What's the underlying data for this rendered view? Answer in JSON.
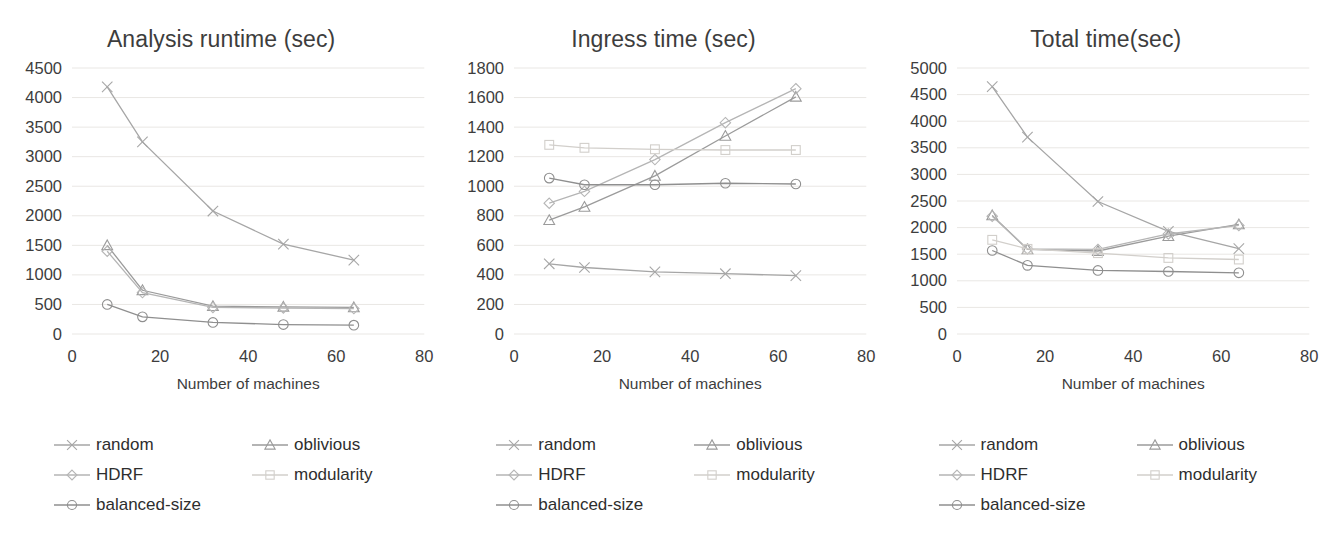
{
  "series_meta": [
    {
      "key": "random",
      "label": "random",
      "marker": "cross",
      "color": "#a6a6a6"
    },
    {
      "key": "oblivious",
      "label": "oblivious",
      "marker": "triangle",
      "color": "#9b9b9b"
    },
    {
      "key": "HDRF",
      "label": "HDRF",
      "marker": "diamond",
      "color": "#b5b5b5"
    },
    {
      "key": "modularity",
      "label": "modularity",
      "marker": "square",
      "color": "#d2cfcb"
    },
    {
      "key": "balanced-size",
      "label": "balanced-size",
      "marker": "circle",
      "color": "#8f8f8f"
    }
  ],
  "legend": {
    "order": [
      "random",
      "oblivious",
      "HDRF",
      "modularity",
      "balanced-size"
    ],
    "labels": {
      "random": "random",
      "oblivious": "oblivious",
      "HDRF": "HDRF",
      "modularity": "modularity",
      "balanced-size": "balanced-size"
    }
  },
  "chart_data": [
    {
      "type": "line",
      "title": "Analysis runtime (sec)",
      "xlabel": "Number of machines",
      "ylabel": "",
      "x": [
        8,
        16,
        32,
        48,
        64
      ],
      "xlim": [
        0,
        80
      ],
      "xticks": [
        0,
        20,
        40,
        60,
        80
      ],
      "ylim": [
        0,
        4500
      ],
      "yticks": [
        0,
        500,
        1000,
        1500,
        2000,
        2500,
        3000,
        3500,
        4000,
        4500
      ],
      "grid": true,
      "legend_position": "bottom",
      "series": [
        {
          "name": "random",
          "values": [
            4180,
            3250,
            2080,
            1520,
            1250
          ]
        },
        {
          "name": "oblivious",
          "values": [
            1500,
            740,
            470,
            460,
            450
          ]
        },
        {
          "name": "HDRF",
          "values": [
            1400,
            700,
            450,
            440,
            430
          ]
        },
        {
          "name": "modularity",
          "values": [
            null,
            null,
            null,
            null,
            null
          ]
        },
        {
          "name": "balanced-size",
          "values": [
            500,
            290,
            195,
            160,
            150
          ]
        }
      ]
    },
    {
      "type": "line",
      "title": "Ingress time (sec)",
      "xlabel": "Number of machines",
      "ylabel": "",
      "x": [
        8,
        16,
        32,
        48,
        64
      ],
      "xlim": [
        0,
        80
      ],
      "xticks": [
        0,
        20,
        40,
        60,
        80
      ],
      "ylim": [
        0,
        1800
      ],
      "yticks": [
        0,
        200,
        400,
        600,
        800,
        1000,
        1200,
        1400,
        1600,
        1800
      ],
      "grid": true,
      "legend_position": "bottom",
      "series": [
        {
          "name": "random",
          "values": [
            475,
            450,
            420,
            408,
            395
          ]
        },
        {
          "name": "oblivious",
          "values": [
            770,
            860,
            1070,
            1340,
            1605
          ]
        },
        {
          "name": "HDRF",
          "values": [
            885,
            965,
            1180,
            1430,
            1660
          ]
        },
        {
          "name": "modularity",
          "values": [
            1280,
            1260,
            1250,
            1245,
            1245
          ]
        },
        {
          "name": "balanced-size",
          "values": [
            1055,
            1010,
            1010,
            1020,
            1015
          ]
        }
      ]
    },
    {
      "type": "line",
      "title": "Total time(sec)",
      "xlabel": "Number of machines",
      "ylabel": "",
      "x": [
        8,
        16,
        32,
        48,
        64
      ],
      "xlim": [
        0,
        80
      ],
      "xticks": [
        0,
        20,
        40,
        60,
        80
      ],
      "ylim": [
        0,
        5000
      ],
      "yticks": [
        0,
        500,
        1000,
        1500,
        2000,
        2500,
        3000,
        3500,
        4000,
        4500,
        5000
      ],
      "grid": true,
      "legend_position": "bottom",
      "series": [
        {
          "name": "random",
          "values": [
            4650,
            3700,
            2490,
            1930,
            1605
          ]
        },
        {
          "name": "oblivious",
          "values": [
            2230,
            1590,
            1560,
            1840,
            2060
          ]
        },
        {
          "name": "HDRF",
          "values": [
            2215,
            1600,
            1590,
            1880,
            2040
          ]
        },
        {
          "name": "modularity",
          "values": [
            1770,
            1600,
            1520,
            1430,
            1400
          ]
        },
        {
          "name": "balanced-size",
          "values": [
            1570,
            1290,
            1195,
            1175,
            1150
          ]
        }
      ]
    }
  ]
}
